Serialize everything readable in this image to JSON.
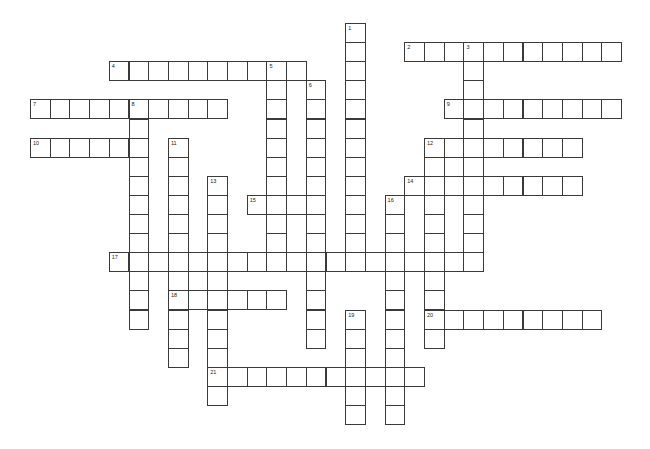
{
  "puzzle": {
    "type": "crossword",
    "grid": {
      "origin_x": 30,
      "origin_y": 23,
      "cell_w": 19.7,
      "cell_h": 19.1,
      "line_color": "#3a3a3a"
    },
    "entries": [
      {
        "number": "1",
        "direction": "down",
        "row": 0,
        "col": 16,
        "length": 13
      },
      {
        "number": "2",
        "direction": "across",
        "row": 1,
        "col": 19,
        "length": 11
      },
      {
        "number": "3",
        "direction": "down",
        "row": 1,
        "col": 22,
        "length": 12
      },
      {
        "number": "4",
        "direction": "across",
        "row": 2,
        "col": 4,
        "length": 10
      },
      {
        "number": "5",
        "direction": "down",
        "row": 2,
        "col": 12,
        "length": 11
      },
      {
        "number": "6",
        "direction": "down",
        "row": 3,
        "col": 14,
        "length": 14
      },
      {
        "number": "7",
        "direction": "across",
        "row": 4,
        "col": 0,
        "length": 10
      },
      {
        "number": "8",
        "direction": "down",
        "row": 4,
        "col": 5,
        "length": 12
      },
      {
        "number": "9",
        "direction": "across",
        "row": 4,
        "col": 21,
        "length": 9
      },
      {
        "number": "10",
        "direction": "across",
        "row": 6,
        "col": 0,
        "length": 6
      },
      {
        "number": "11",
        "direction": "down",
        "row": 6,
        "col": 7,
        "length": 12
      },
      {
        "number": "12",
        "direction": "across",
        "row": 6,
        "col": 20,
        "length": 8
      },
      {
        "number": "12",
        "direction": "down",
        "row": 6,
        "col": 20,
        "length": 11
      },
      {
        "number": "13",
        "direction": "down",
        "row": 8,
        "col": 9,
        "length": 12
      },
      {
        "number": "14",
        "direction": "across",
        "row": 8,
        "col": 19,
        "length": 9
      },
      {
        "number": "15",
        "direction": "across",
        "row": 9,
        "col": 11,
        "length": 4
      },
      {
        "number": "16",
        "direction": "down",
        "row": 9,
        "col": 18,
        "length": 12
      },
      {
        "number": "17",
        "direction": "across",
        "row": 12,
        "col": 4,
        "length": 19
      },
      {
        "number": "18",
        "direction": "across",
        "row": 14,
        "col": 7,
        "length": 6
      },
      {
        "number": "19",
        "direction": "down",
        "row": 15,
        "col": 16,
        "length": 6
      },
      {
        "number": "20",
        "direction": "across",
        "row": 15,
        "col": 20,
        "length": 9
      },
      {
        "number": "21",
        "direction": "across",
        "row": 18,
        "col": 9,
        "length": 11
      }
    ]
  }
}
